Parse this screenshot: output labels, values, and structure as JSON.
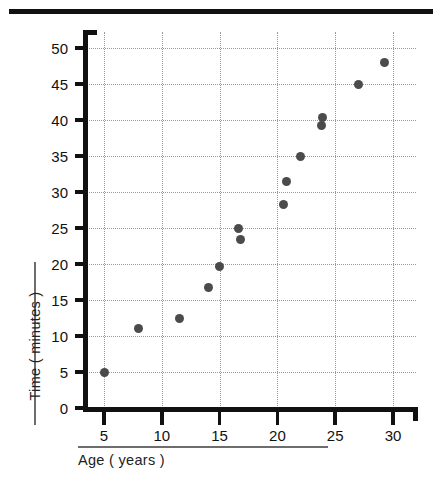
{
  "chart_data": {
    "type": "scatter",
    "title": "",
    "xlabel": "Age ( years )",
    "ylabel": "Time ( minutes )",
    "xlim": [
      3.2,
      32.0
    ],
    "ylim": [
      0,
      52
    ],
    "xticks": [
      5,
      10,
      15,
      20,
      25,
      30
    ],
    "yticks": [
      0,
      5,
      10,
      15,
      20,
      25,
      30,
      35,
      40,
      45,
      50
    ],
    "grid": true,
    "grid_style": "dotted",
    "legend": "none",
    "marker_color": "#4b4b4b",
    "axis_color": "#111111",
    "points": [
      {
        "x": 5.0,
        "y": 5.0
      },
      {
        "x": 8.0,
        "y": 11.0
      },
      {
        "x": 11.5,
        "y": 12.5
      },
      {
        "x": 14.0,
        "y": 16.7
      },
      {
        "x": 15.0,
        "y": 19.6
      },
      {
        "x": 16.6,
        "y": 25.0
      },
      {
        "x": 16.8,
        "y": 23.4
      },
      {
        "x": 20.5,
        "y": 28.3
      },
      {
        "x": 20.8,
        "y": 31.5
      },
      {
        "x": 22.0,
        "y": 35.0
      },
      {
        "x": 23.8,
        "y": 39.3
      },
      {
        "x": 23.9,
        "y": 40.3
      },
      {
        "x": 27.0,
        "y": 45.0
      },
      {
        "x": 29.3,
        "y": 48.0
      }
    ]
  },
  "axis": {
    "x_title": "Age ( years )",
    "y_title": "Time ( minutes )",
    "x_tick_labels": [
      "5",
      "10",
      "15",
      "20",
      "25",
      "30"
    ],
    "y_tick_labels": [
      "0",
      "5",
      "10",
      "15",
      "20",
      "25",
      "30",
      "35",
      "40",
      "45",
      "50"
    ]
  }
}
